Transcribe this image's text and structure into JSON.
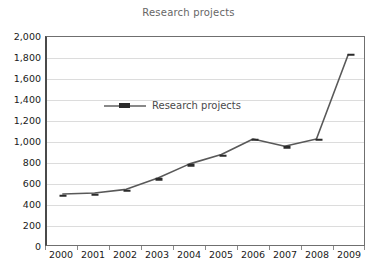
{
  "chart_data": {
    "type": "line",
    "title": "Research projects",
    "xlabel": "",
    "ylabel": "",
    "categories": [
      "2000",
      "2001",
      "2002",
      "2003",
      "2004",
      "2005",
      "2006",
      "2007",
      "2008",
      "2009"
    ],
    "series": [
      {
        "name": "Research projects",
        "values": [
          490,
          500,
          535,
          645,
          780,
          870,
          1020,
          950,
          1020,
          1830
        ],
        "color": "#595959",
        "marker_color": "#2b2b2b"
      }
    ],
    "ylim": [
      0,
      2000
    ],
    "y_tick_step": 200,
    "y_tick_labels": [
      "0",
      "200",
      "400",
      "600",
      "800",
      "1,000",
      "1,200",
      "1,400",
      "1,600",
      "1,800",
      "2,000"
    ],
    "y_tick_values": [
      0,
      200,
      400,
      600,
      800,
      1000,
      1200,
      1400,
      1600,
      1800,
      2000
    ],
    "grid": true,
    "grid_color": "#dcdcdc",
    "legend_position": "inside-top-left",
    "legend_entries": [
      "Research projects"
    ],
    "plot_background": "#ffffff",
    "axis_color": "#4a4a4a",
    "title_color": "#666666"
  }
}
